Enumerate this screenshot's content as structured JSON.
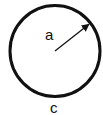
{
  "diagram": {
    "shape": "circle",
    "radius_label": "a",
    "circumference_label": "c",
    "stroke_color": "#111111",
    "background": "#ffffff"
  }
}
